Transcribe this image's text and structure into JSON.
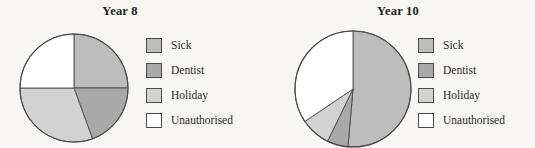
{
  "figure": {
    "type": "pie-chart-pair",
    "background_color": "#f7f6f3",
    "ink_color": "#231f20"
  },
  "palette": {
    "sick": "#bdbdbd",
    "dentist": "#a9a9a9",
    "holiday": "#d2d2d2",
    "unauthorised": "#ffffff",
    "outline": "#4c4a48"
  },
  "charts": [
    {
      "id": "year8",
      "title": "Year 8",
      "legend": [
        {
          "label": "Sick",
          "color": "#bdbdbd"
        },
        {
          "label": "Dentist",
          "color": "#a9a9a9"
        },
        {
          "label": "Holiday",
          "color": "#d2d2d2"
        },
        {
          "label": "Unauthorised",
          "color": "#ffffff"
        }
      ]
    },
    {
      "id": "year10",
      "title": "Year 10",
      "legend": [
        {
          "label": "Sick",
          "color": "#bdbdbd"
        },
        {
          "label": "Dentist",
          "color": "#a9a9a9"
        },
        {
          "label": "Holiday",
          "color": "#d2d2d2"
        },
        {
          "label": "Unauthorised",
          "color": "#ffffff"
        }
      ]
    }
  ],
  "chart_data": [
    {
      "type": "pie",
      "title": "Year 8",
      "labels": [
        "Sick",
        "Dentist",
        "Holiday",
        "Unauthorised"
      ],
      "values": [
        25,
        19,
        31,
        25
      ],
      "units": "percent",
      "start_angle_deg": 0,
      "direction": "clockwise",
      "slice_angles_deg": [
        {
          "label": "Sick",
          "start": 0,
          "end": 90
        },
        {
          "label": "Dentist",
          "start": 90,
          "end": 160
        },
        {
          "label": "Holiday",
          "start": 160,
          "end": 270
        },
        {
          "label": "Unauthorised",
          "start": 270,
          "end": 360
        }
      ],
      "colors": [
        "#bdbdbd",
        "#a9a9a9",
        "#d2d2d2",
        "#ffffff"
      ],
      "legend_position": "right",
      "grid": false
    },
    {
      "type": "pie",
      "title": "Year 10",
      "labels": [
        "Sick",
        "Dentist",
        "Holiday",
        "Unauthorised"
      ],
      "values": [
        51,
        6,
        8,
        35
      ],
      "units": "percent",
      "start_angle_deg": 0,
      "direction": "clockwise",
      "slice_angles_deg": [
        {
          "label": "Sick",
          "start": 0,
          "end": 185
        },
        {
          "label": "Dentist",
          "start": 185,
          "end": 206
        },
        {
          "label": "Holiday",
          "start": 206,
          "end": 236
        },
        {
          "label": "Unauthorised",
          "start": 236,
          "end": 360
        }
      ],
      "colors": [
        "#bdbdbd",
        "#a9a9a9",
        "#d2d2d2",
        "#ffffff"
      ],
      "legend_position": "right",
      "grid": false
    }
  ]
}
